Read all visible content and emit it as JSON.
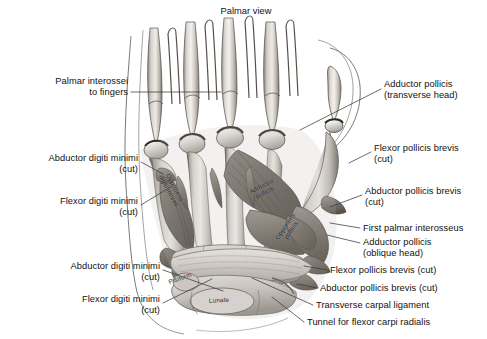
{
  "figure": {
    "title": "Palmar view",
    "view_type": "palmar"
  },
  "labels_left": [
    {
      "id": "palmar-interossei-to-fingers",
      "text": "Palmar interossei\nto fingers",
      "x": 18,
      "y": 76,
      "w": 110,
      "leader": [
        [
          131,
          92
        ],
        [
          221,
          92
        ]
      ]
    },
    {
      "id": "abductor-digiti-minimi-upper",
      "text": "Abductor digiti minimi\n(cut)",
      "x": 8,
      "y": 153,
      "w": 130,
      "leader": [
        [
          141,
          162
        ],
        [
          163,
          174
        ]
      ]
    },
    {
      "id": "flexor-digiti-minimi-upper",
      "text": "Flexor digiti minimi\n(cut)",
      "x": 18,
      "y": 196,
      "w": 120,
      "leader": [
        [
          141,
          205
        ],
        [
          172,
          186
        ]
      ]
    },
    {
      "id": "abductor-digiti-minimi-lower",
      "text": "Abductor digiti minimi\n(cut)",
      "x": 30,
      "y": 261,
      "w": 130,
      "leader": [
        [
          163,
          270
        ],
        [
          223,
          291
        ]
      ]
    },
    {
      "id": "flexor-digiti-minimi-lower",
      "text": "Flexor digiti minimi\n(cut)",
      "x": 42,
      "y": 294,
      "w": 118,
      "leader": [
        [
          163,
          303
        ],
        [
          212,
          279
        ]
      ]
    }
  ],
  "labels_right": [
    {
      "id": "adductor-pollicis-transverse-head",
      "text": "Adductor pollicis\n(transverse head)",
      "x": 384,
      "y": 79,
      "w": 100,
      "leader": [
        [
          381,
          89
        ],
        [
          300,
          130
        ]
      ]
    },
    {
      "id": "flexor-pollicis-brevis-cut-upper",
      "text": "Flexor pollicis brevis\n(cut)",
      "x": 374,
      "y": 143,
      "w": 112,
      "leader": [
        [
          371,
          152
        ],
        [
          349,
          163
        ]
      ]
    },
    {
      "id": "abductor-pollicis-brevis-cut-upper",
      "text": "Abductor pollicis brevis\n(cut)",
      "x": 365,
      "y": 186,
      "w": 122,
      "leader": [
        [
          362,
          195
        ],
        [
          330,
          207
        ]
      ]
    },
    {
      "id": "first-palmar-interosseus",
      "text": "First palmar interosseus",
      "x": 363,
      "y": 223,
      "w": 124,
      "leader": [
        [
          360,
          228
        ],
        [
          330,
          223
        ]
      ]
    },
    {
      "id": "adductor-pollicis-oblique-head",
      "text": "Adductor pollicis\n(oblique head)",
      "x": 363,
      "y": 237,
      "w": 100,
      "leader": [
        [
          360,
          243
        ],
        [
          327,
          235
        ]
      ]
    },
    {
      "id": "flexor-pollicis-brevis-cut-lower",
      "text": "Flexor pollicis brevis (cut)",
      "x": 330,
      "y": 265,
      "w": 156,
      "leader": [
        [
          327,
          270
        ],
        [
          304,
          266
        ]
      ]
    },
    {
      "id": "abductor-pollicis-brevis-cut-lower",
      "text": "Abductor pollicis brevis (cut)",
      "x": 320,
      "y": 283,
      "w": 166,
      "leader": [
        [
          317,
          288
        ],
        [
          297,
          284
        ]
      ]
    },
    {
      "id": "transverse-carpal-ligament",
      "text": "Transverse carpal ligament",
      "x": 316,
      "y": 300,
      "w": 170,
      "leader": [
        [
          313,
          305
        ],
        [
          252,
          278
        ]
      ]
    },
    {
      "id": "tunnel-for-flexor-carpi-radialis",
      "text": "Tunnel for flexor carpi radialis",
      "x": 307,
      "y": 317,
      "w": 180,
      "leader": [
        [
          304,
          322
        ],
        [
          272,
          297
        ]
      ]
    }
  ],
  "labels_in_image": [
    {
      "id": "opponens-digiti-minimi",
      "text": "Opponens\ndigiti minimi",
      "x": 172,
      "y": 189,
      "rot": 62
    },
    {
      "id": "adductor-pollicis-inline",
      "text": "Adductor\npollicis",
      "x": 263,
      "y": 189,
      "rot": -27
    },
    {
      "id": "opponens-pollicis-inline",
      "text": "Opponens\npollicis",
      "x": 288,
      "y": 228,
      "rot": -56
    },
    {
      "id": "pisiform-inline",
      "text": "Pisiform",
      "x": 180,
      "y": 278,
      "rot": -20
    },
    {
      "id": "lunate-inline",
      "text": "Lunate",
      "x": 219,
      "y": 300,
      "rot": -4
    }
  ],
  "colors": {
    "background": "#ffffff",
    "text": "#111111",
    "leader_line": "#3a3a3a",
    "bone_light": "#f2f0ee",
    "bone_mid": "#cfcac5",
    "bone_shadow": "#8e8983",
    "muscle_dark": "#6a6660",
    "muscle_mid": "#9a948d",
    "outline": "#4a4a4a"
  }
}
